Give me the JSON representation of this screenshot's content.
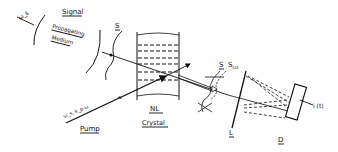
{
  "diagram": {
    "type": "optical heterodyne setup (nonlinear crystal mixing)",
    "labels": {
      "signal_freq": "ω_s",
      "signal": "Signal",
      "propagating": "Propagating",
      "medium": "Medium",
      "wavefront_s": "S",
      "wavefront_s2": "S",
      "local_osc": "S_LO",
      "pump_freq": "ω_s, k_p·ω",
      "pump": "Pump",
      "nl": "NL",
      "crystal": "Crystal",
      "lens": "L",
      "detector": "D",
      "output": "i (t)"
    }
  }
}
